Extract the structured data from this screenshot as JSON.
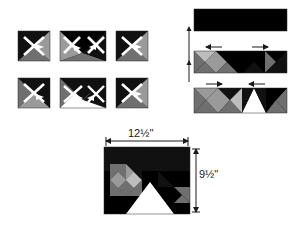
{
  "figure": {
    "kind": "quilt-block-assembly-diagram",
    "background_color": "#ffffff"
  },
  "palette": {
    "dark": "#111111",
    "black": "#000000",
    "medium_gray": "#6f6f6f",
    "light_gray": "#9a9a9a",
    "pale_gray": "#bdbdbd",
    "white": "#ffffff",
    "outline": "#2b2b2b",
    "arrow": "#1a1a1a",
    "dimension_line": "#1a1a1a"
  },
  "units_panel": {
    "name": "pieced-units-grid",
    "rows": 2,
    "columns": 3,
    "units": [
      {
        "id": "unit-r1c1",
        "row": 1,
        "col": 1,
        "type": "quarter-square",
        "colors": [
          "dark",
          "medium_gray",
          "light_gray",
          "dark"
        ]
      },
      {
        "id": "unit-r1c2",
        "row": 1,
        "col": 2,
        "type": "flying-geese-pair",
        "colors": [
          "dark",
          "light_gray",
          "medium_gray"
        ]
      },
      {
        "id": "unit-r1c3",
        "row": 1,
        "col": 3,
        "type": "quarter-square",
        "colors": [
          "dark",
          "medium_gray",
          "light_gray",
          "dark"
        ]
      },
      {
        "id": "unit-r2c1",
        "row": 2,
        "col": 1,
        "type": "quarter-square",
        "colors": [
          "medium_gray",
          "dark",
          "light_gray",
          "dark"
        ]
      },
      {
        "id": "unit-r2c2",
        "row": 2,
        "col": 2,
        "type": "flying-geese-white",
        "colors": [
          "medium_gray",
          "white",
          "dark"
        ]
      },
      {
        "id": "unit-r2c3",
        "row": 2,
        "col": 3,
        "type": "quarter-square",
        "colors": [
          "dark",
          "medium_gray",
          "light_gray",
          "dark"
        ]
      }
    ]
  },
  "strips_panel": {
    "name": "row-assembly-strips",
    "strips": [
      {
        "id": "strip-1",
        "label": "",
        "description": "solid dark background strip"
      },
      {
        "id": "strip-2",
        "label": "",
        "description": "strip with pieced units pressed"
      },
      {
        "id": "strip-3",
        "label": "",
        "description": "strip with white center triangle"
      }
    ],
    "seam_arrows": [
      {
        "strip": "strip-2",
        "side": "left",
        "direction": "left"
      },
      {
        "strip": "strip-2",
        "side": "right",
        "direction": "right"
      },
      {
        "strip": "strip-3",
        "side": "left",
        "direction": "right"
      },
      {
        "strip": "strip-3",
        "side": "right",
        "direction": "left"
      }
    ]
  },
  "finished_block": {
    "name": "finished-block",
    "width_label": "12½\"",
    "height_label": "9½\"",
    "width_value": 12.5,
    "height_value": 9.5,
    "units": "inches"
  }
}
